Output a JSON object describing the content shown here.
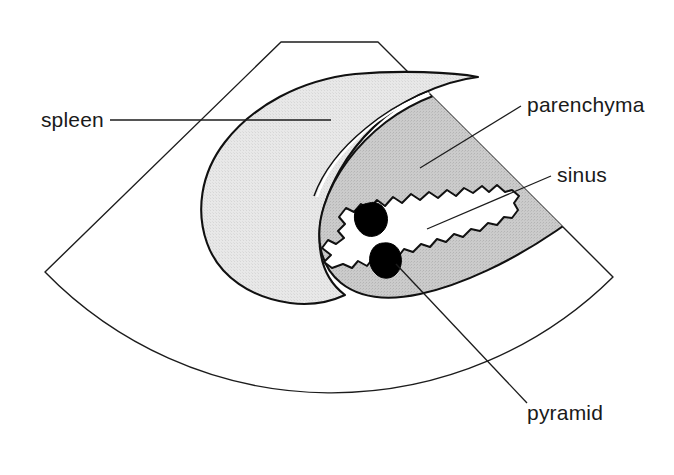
{
  "figure": {
    "type": "anatomical-ultrasound-schematic",
    "background_color": "#ffffff",
    "line_color": "#1c1c1c"
  },
  "scan_sector": {
    "name": "ultrasound-sector-outline",
    "description": "Trapezoidal-topped fan-shaped ultrasound scan field with curved bottom arc",
    "stroke_color": "#1c1c1c",
    "fill_color": "#ffffff",
    "path": "M 281 42 L 378 42 L 613 277 A 400 400 0 0 1 45 272 Z"
  },
  "regions": [
    {
      "id": "spleen",
      "name": "spleen-region",
      "fill_color": "#e3e3e3",
      "stroke_color": "#111111",
      "description": "Large light-grey oval organ occupying left and centre of the scan field"
    },
    {
      "id": "kidney",
      "name": "kidney-parenchyma-region",
      "fill_color": "#c5c5c5",
      "stroke_color": "#111111",
      "description": "Darker grey elongated kidney overlapping the spleen on the right, parenchyma band"
    },
    {
      "id": "sinus",
      "name": "renal-sinus-region",
      "fill_color": "#ffffff",
      "stroke_color": "#111111",
      "description": "White jagged wavy central region of the kidney representing the renal sinus"
    },
    {
      "id": "pyramid-upper",
      "name": "renal-pyramid-upper",
      "fill_color": "#000000",
      "stroke_color": "#000000",
      "description": "Upper black irregular blob representing a renal pyramid"
    },
    {
      "id": "pyramid-lower",
      "name": "renal-pyramid-lower",
      "fill_color": "#000000",
      "stroke_color": "#000000",
      "description": "Lower black irregular blob representing a renal pyramid"
    }
  ],
  "labels": [
    {
      "id": "spleen",
      "text": "spleen",
      "anchor": "end",
      "x": 104,
      "y": 127,
      "leader": "M 110 120 L 331 120"
    },
    {
      "id": "parenchyma",
      "text": "parenchyma",
      "anchor": "start",
      "x": 527,
      "y": 112,
      "leader": "M 420 168 L 521 106"
    },
    {
      "id": "sinus",
      "text": "sinus",
      "anchor": "start",
      "x": 557,
      "y": 182,
      "leader": "M 427 229 L 551 176"
    },
    {
      "id": "pyramid",
      "text": "pyramid",
      "anchor": "start",
      "x": 527,
      "y": 420,
      "leader": "M 396 264 L 527 403"
    }
  ]
}
